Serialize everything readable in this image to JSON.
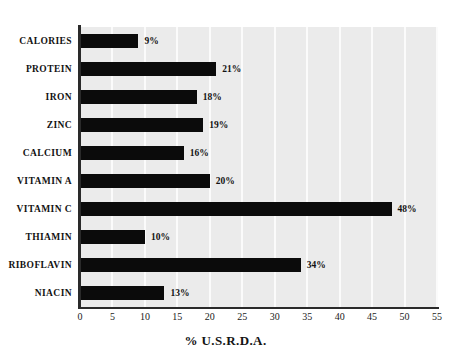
{
  "chart_data": {
    "type": "bar",
    "orientation": "horizontal",
    "title": "",
    "xlabel": "% U.S.R.D.A.",
    "ylabel": "",
    "xlim": [
      0,
      55
    ],
    "xticks": [
      0,
      5,
      10,
      15,
      20,
      25,
      30,
      35,
      40,
      45,
      50,
      55
    ],
    "xtick_labels": [
      "0",
      "5",
      "10",
      "15",
      "20",
      "25",
      "30",
      "35",
      "40",
      "45",
      "50",
      "55"
    ],
    "grid": "vertical-white-gridlines",
    "legend": "none",
    "categories": [
      "CALORIES",
      "PROTEIN",
      "IRON",
      "ZINC",
      "CALCIUM",
      "VITAMIN A",
      "VITAMIN C",
      "THIAMIN",
      "RIBOFLAVIN",
      "NIACIN"
    ],
    "values": [
      9,
      21,
      18,
      19,
      16,
      20,
      48,
      10,
      34,
      13
    ],
    "data_labels": [
      "9%",
      "21%",
      "18%",
      "19%",
      "16%",
      "20%",
      "48%",
      "10%",
      "34%",
      "13%"
    ],
    "bar_color": "#0b0b0b",
    "plot_background": "#ebebeb",
    "gridline_color": "#fbfbfb",
    "axis_color": "#2a2a2a",
    "page_background": "#ffffff"
  },
  "top_ghost_text": ""
}
